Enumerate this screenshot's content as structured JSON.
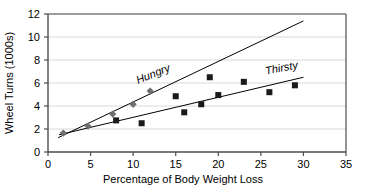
{
  "chart_data": {
    "type": "scatter",
    "title": "",
    "subtitle": "",
    "xlabel": "Percentage of Body Weight Loss",
    "ylabel": "Wheel Turns (1000s)",
    "xlim": [
      0,
      35
    ],
    "ylim": [
      0,
      12
    ],
    "xticks": [
      0,
      5,
      10,
      15,
      20,
      25,
      30,
      35
    ],
    "yticks": [
      0,
      2,
      4,
      6,
      8,
      10,
      12
    ],
    "xtick_labels": [
      "0",
      "5",
      "10",
      "15",
      "20",
      "25",
      "30",
      "35"
    ],
    "ytick_labels": [
      "0",
      "2",
      "4",
      "6",
      "8",
      "10",
      "12"
    ],
    "grid": "horizontal",
    "legend_position": "inline-annotation",
    "series": [
      {
        "name": "Hungry",
        "marker": "diamond",
        "marker_color": "#6e6e6e",
        "line_color": "#000000",
        "points": [
          {
            "x": 1.8,
            "y": 1.65
          },
          {
            "x": 4.7,
            "y": 2.25
          },
          {
            "x": 7.6,
            "y": 3.3
          },
          {
            "x": 10.0,
            "y": 4.15
          },
          {
            "x": 12.0,
            "y": 5.3
          }
        ],
        "trendline": {
          "x0": 1.2,
          "y0": 1.25,
          "x1": 30.0,
          "y1": 11.4
        }
      },
      {
        "name": "Thirsty",
        "marker": "square",
        "marker_color": "#1a1a1a",
        "line_color": "#000000",
        "points": [
          {
            "x": 8.0,
            "y": 2.75
          },
          {
            "x": 11.0,
            "y": 2.5
          },
          {
            "x": 15.0,
            "y": 4.85
          },
          {
            "x": 16.0,
            "y": 3.45
          },
          {
            "x": 18.0,
            "y": 4.15
          },
          {
            "x": 19.0,
            "y": 6.5
          },
          {
            "x": 20.0,
            "y": 4.95
          },
          {
            "x": 23.0,
            "y": 6.1
          },
          {
            "x": 26.0,
            "y": 5.2
          },
          {
            "x": 29.0,
            "y": 5.8
          }
        ],
        "trendline": {
          "x0": 1.3,
          "y0": 1.5,
          "x1": 30.0,
          "y1": 6.5
        }
      }
    ],
    "annotations": [
      {
        "text": "Hungry",
        "x": 12.5,
        "y": 6.5,
        "rotation": -22
      },
      {
        "text": "Thirsty",
        "x": 27.5,
        "y": 7.0,
        "rotation": -11
      }
    ]
  },
  "colors": {
    "axis": "#4d4d4d",
    "grid": "#d9d9d9",
    "plot_background": "#ffffff",
    "trendline": "#000000",
    "hungry_marker": "#6e6e6e",
    "thirsty_marker": "#1a1a1a"
  }
}
